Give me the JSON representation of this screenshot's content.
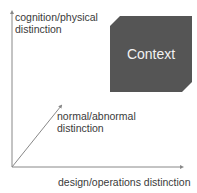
{
  "diagram": {
    "axes": {
      "y_label": [
        "cognition/physical",
        "distinction"
      ],
      "z_label": [
        "normal/abnormal",
        "distinction"
      ],
      "x_label": "design/operations distinction"
    },
    "box": {
      "label": "Context",
      "fill": "#555555",
      "text_color": "#f2f2f2"
    },
    "colors": {
      "axis": "#888888",
      "text": "#3a3a3a"
    }
  }
}
